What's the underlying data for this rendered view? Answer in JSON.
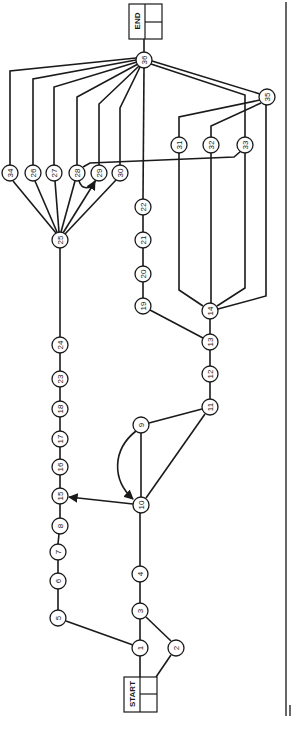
{
  "diagram": {
    "type": "activity-network (rotated 90° counter-clockwise)",
    "start_label": "START",
    "end_label": "END",
    "nodes": [
      {
        "id": "1",
        "x": 140,
        "y": 648
      },
      {
        "id": "2",
        "x": 176,
        "y": 648
      },
      {
        "id": "3",
        "x": 140,
        "y": 611
      },
      {
        "id": "4",
        "x": 140,
        "y": 574
      },
      {
        "id": "5",
        "x": 58,
        "y": 618
      },
      {
        "id": "6",
        "x": 58,
        "y": 581
      },
      {
        "id": "7",
        "x": 58,
        "y": 552
      },
      {
        "id": "8",
        "x": 60,
        "y": 526
      },
      {
        "id": "9",
        "x": 141,
        "y": 425
      },
      {
        "id": "10",
        "x": 141,
        "y": 505
      },
      {
        "id": "11",
        "x": 210,
        "y": 407
      },
      {
        "id": "12",
        "x": 210,
        "y": 374
      },
      {
        "id": "13",
        "x": 210,
        "y": 342
      },
      {
        "id": "14",
        "x": 210,
        "y": 311
      },
      {
        "id": "15",
        "x": 60,
        "y": 496
      },
      {
        "id": "16",
        "x": 60,
        "y": 467
      },
      {
        "id": "17",
        "x": 60,
        "y": 439
      },
      {
        "id": "18",
        "x": 60,
        "y": 409
      },
      {
        "id": "19",
        "x": 143,
        "y": 306
      },
      {
        "id": "20",
        "x": 143,
        "y": 274
      },
      {
        "id": "21",
        "x": 143,
        "y": 240
      },
      {
        "id": "22",
        "x": 143,
        "y": 207
      },
      {
        "id": "23",
        "x": 60,
        "y": 379
      },
      {
        "id": "24",
        "x": 60,
        "y": 345
      },
      {
        "id": "25",
        "x": 60,
        "y": 240
      },
      {
        "id": "26",
        "x": 33,
        "y": 173
      },
      {
        "id": "27",
        "x": 54,
        "y": 173
      },
      {
        "id": "28",
        "x": 77,
        "y": 173
      },
      {
        "id": "29",
        "x": 99,
        "y": 173
      },
      {
        "id": "30",
        "x": 120,
        "y": 173
      },
      {
        "id": "31",
        "x": 179,
        "y": 145
      },
      {
        "id": "32",
        "x": 211,
        "y": 145
      },
      {
        "id": "33",
        "x": 245,
        "y": 145
      },
      {
        "id": "34",
        "x": 10,
        "y": 173
      },
      {
        "id": "35",
        "x": 267,
        "y": 97
      },
      {
        "id": "36",
        "x": 144,
        "y": 60
      }
    ],
    "edges": [
      [
        "START",
        "1"
      ],
      [
        "START",
        "2"
      ],
      [
        "1",
        "3"
      ],
      [
        "2",
        "3"
      ],
      [
        "1",
        "5"
      ],
      [
        "3",
        "4"
      ],
      [
        "4",
        "10"
      ],
      [
        "5",
        "6"
      ],
      [
        "6",
        "7"
      ],
      [
        "7",
        "8"
      ],
      [
        "8",
        "15"
      ],
      [
        "10",
        "15"
      ],
      [
        "10",
        "9"
      ],
      [
        "9",
        "10"
      ],
      [
        "10",
        "11"
      ],
      [
        "9",
        "11"
      ],
      [
        "11",
        "12"
      ],
      [
        "12",
        "13"
      ],
      [
        "13",
        "19"
      ],
      [
        "13",
        "14"
      ],
      [
        "19",
        "20"
      ],
      [
        "20",
        "21"
      ],
      [
        "21",
        "22"
      ],
      [
        "22",
        "36"
      ],
      [
        "15",
        "16"
      ],
      [
        "16",
        "17"
      ],
      [
        "17",
        "18"
      ],
      [
        "18",
        "23"
      ],
      [
        "23",
        "24"
      ],
      [
        "24",
        "25"
      ],
      [
        "25",
        "34"
      ],
      [
        "25",
        "26"
      ],
      [
        "25",
        "27"
      ],
      [
        "25",
        "28"
      ],
      [
        "25",
        "29"
      ],
      [
        "25",
        "30"
      ],
      [
        "34",
        "36"
      ],
      [
        "26",
        "36"
      ],
      [
        "27",
        "36"
      ],
      [
        "28",
        "36"
      ],
      [
        "29",
        "36"
      ],
      [
        "30",
        "36"
      ],
      [
        "28",
        "29"
      ],
      [
        "33",
        "28"
      ],
      [
        "14",
        "31"
      ],
      [
        "14",
        "32"
      ],
      [
        "14",
        "33"
      ],
      [
        "14",
        "35"
      ],
      [
        "31",
        "35"
      ],
      [
        "32",
        "35"
      ],
      [
        "33",
        "36"
      ],
      [
        "35",
        "36"
      ],
      [
        "36",
        "END"
      ]
    ]
  }
}
